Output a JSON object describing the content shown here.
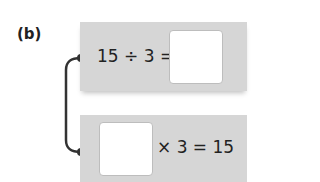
{
  "label": "(b)",
  "top_card": {
    "equation": "15 ÷ 3 =",
    "answer": ""
  },
  "bottom_card": {
    "answer": "",
    "equation": "× 3 = 15"
  },
  "colors": {
    "card": "#d6d6d6",
    "connector": "#333333",
    "box": "#ffffff"
  }
}
